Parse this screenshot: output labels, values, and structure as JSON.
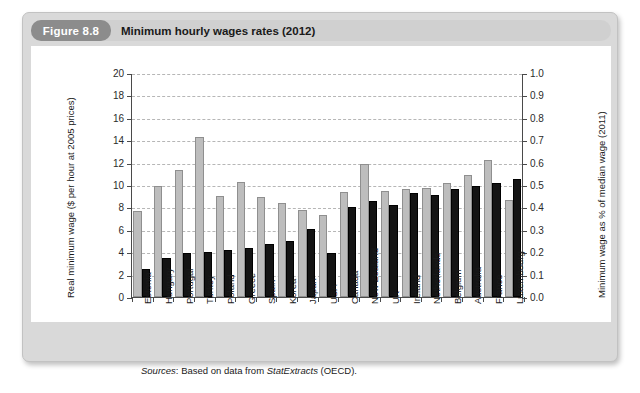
{
  "figure": {
    "tag": "Figure 8.8",
    "title": "Minimum hourly wages rates (2012)",
    "source_prefix": "Sources",
    "source_text_a": ": Based on data from ",
    "source_emphasis": "StatExtracts",
    "source_text_b": " (OECD)."
  },
  "colors": {
    "card_bg": "#d9d9d9",
    "banner_bg": "#d0d0d0",
    "tag_bg": "#8c8c8c",
    "panel_bg": "#ffffff",
    "series_gray": "#bdbdbd",
    "series_black": "#141414",
    "axis": "#4a4a4a",
    "grid": "#b6b6b6"
  },
  "chart_data": {
    "type": "bar",
    "title": "Minimum hourly wages rates (2012)",
    "xlabel": "",
    "ylabel": "Real minimum wage ($ per hour at 2005 prices)",
    "y2label": "Minimum wage as % of median wage (2011)",
    "ylim": [
      0,
      20
    ],
    "y2lim": [
      0.0,
      1.0
    ],
    "yticks": [
      "0",
      "2",
      "4",
      "6",
      "8",
      "10",
      "12",
      "14",
      "16",
      "18",
      "20"
    ],
    "ytick_values": [
      0,
      2,
      4,
      6,
      8,
      10,
      12,
      14,
      16,
      18,
      20
    ],
    "y2ticks": [
      "0.0",
      "0.1",
      "0.2",
      "0.3",
      "0.4",
      "0.5",
      "0.6",
      "0.7",
      "0.8",
      "0.9",
      "1.0"
    ],
    "y2tick_values": [
      0.0,
      0.1,
      0.2,
      0.3,
      0.4,
      0.5,
      0.6,
      0.7,
      0.8,
      0.9,
      1.0
    ],
    "grid": true,
    "legend": "none",
    "categories": [
      "Estonia",
      "Hungary",
      "Portugal",
      "Turkey",
      "Poland",
      "Greece",
      "Spain",
      "Korea",
      "Japan",
      "USA",
      "Canada",
      "New Zealand",
      "UK",
      "Ireland",
      "Netherlands",
      "Belgium",
      "Australia",
      "France",
      "Luxembourg"
    ],
    "series": [
      {
        "name": "Real minimum wage ($ per hour at 2005 prices)",
        "axis": "left",
        "color": "#bdbdbd",
        "values": [
          7.7,
          9.9,
          11.3,
          14.3,
          9.0,
          10.3,
          8.9,
          8.4,
          7.8,
          7.3,
          9.4,
          11.9,
          9.5,
          9.6,
          9.7,
          10.2,
          10.85,
          12.2,
          8.7
        ]
      },
      {
        "name": "Minimum wage as % of median wage (2011)",
        "axis": "right",
        "color": "#141414",
        "values": [
          0.125,
          0.175,
          0.195,
          0.2,
          0.21,
          0.22,
          0.235,
          0.25,
          0.305,
          0.195,
          0.4,
          0.43,
          0.41,
          0.465,
          0.455,
          0.48,
          0.495,
          0.51,
          0.525
        ]
      }
    ]
  }
}
